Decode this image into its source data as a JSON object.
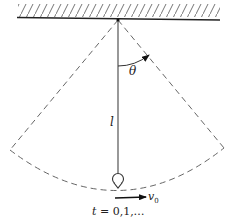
{
  "diagram": {
    "type": "pendulum",
    "labels": {
      "angle": "θ",
      "length": "l",
      "velocity_symbol": "v",
      "velocity_subscript": "0",
      "time_var": "t",
      "time_values": " = 0,1,…"
    },
    "elements": [
      "hatched ceiling",
      "pivot",
      "rod (length l)",
      "bob",
      "dashed swing boundary lines",
      "dashed swing arc",
      "angle arrow θ",
      "initial velocity arrow v0"
    ],
    "colors": {
      "stroke": "#333333",
      "dash": "#555555",
      "background": "#ffffff"
    }
  }
}
